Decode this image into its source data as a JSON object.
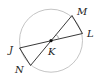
{
  "diagram": {
    "type": "circle-geometry",
    "center": {
      "label": "K",
      "x": 51,
      "y": 40.7
    },
    "circle": {
      "cx": 51,
      "cy": 40.7,
      "r": 31.5,
      "stroke": "#bdbdbd"
    },
    "points": [
      {
        "label": "M",
        "x": 72,
        "y": 15.5,
        "lx": 77,
        "ly": 15
      },
      {
        "label": "L",
        "x": 82.5,
        "y": 33.5,
        "lx": 87,
        "ly": 37
      },
      {
        "label": "J",
        "x": 19.5,
        "y": 48,
        "lx": 10,
        "ly": 53
      },
      {
        "label": "N",
        "x": 30.5,
        "y": 65.5,
        "lx": 16,
        "ly": 73
      },
      {
        "label": "K",
        "x": 51,
        "y": 40.7,
        "lx": 49,
        "ly": 55
      }
    ],
    "segments": [
      {
        "name": "diameter-JL",
        "from": "J",
        "to": "L"
      },
      {
        "name": "diameter-NM",
        "from": "N",
        "to": "M"
      },
      {
        "name": "chord-JN",
        "from": "J",
        "to": "N"
      },
      {
        "name": "chord-ML",
        "from": "M",
        "to": "L"
      }
    ],
    "angle_mark": {
      "vertex": "K",
      "between": [
        "M",
        "L"
      ]
    },
    "line_color": "#222222"
  }
}
